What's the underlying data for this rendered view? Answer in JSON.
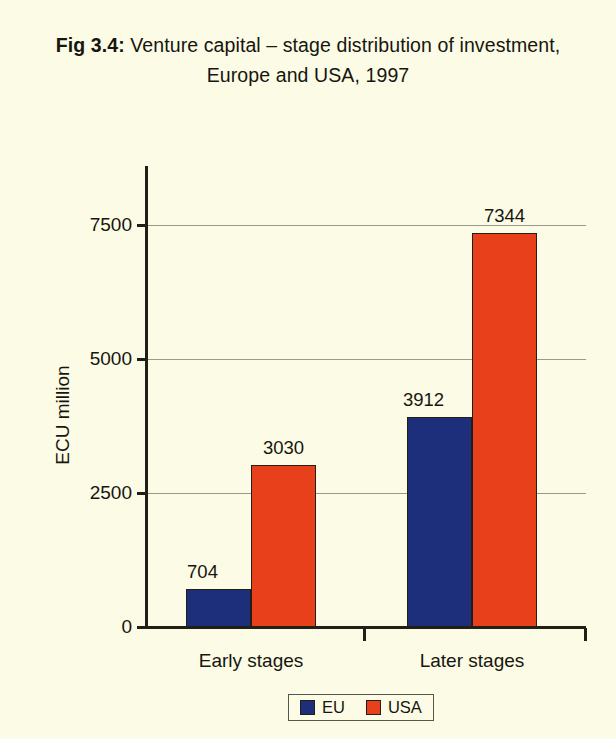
{
  "figure": {
    "title_prefix": "Fig 3.4:",
    "title_text": " Venture capital – stage distribution of investment, Europe and USA, 1997"
  },
  "chart_data": {
    "type": "bar",
    "title": "Fig 3.4: Venture capital – stage distribution of investment, Europe and USA, 1997",
    "categories": [
      "Early stages",
      "Later stages"
    ],
    "series": [
      {
        "name": "EU",
        "color": "#1d2f7b",
        "values": [
          704,
          3912
        ]
      },
      {
        "name": "USA",
        "color": "#e8401a",
        "values": [
          3030,
          7344
        ]
      }
    ],
    "xlabel": "",
    "ylabel": "ECU million",
    "ylim": [
      0,
      8550
    ],
    "yticks": [
      0,
      2500,
      5000,
      7500
    ],
    "ytick_labels": [
      "0",
      "2500",
      "5000",
      "7500"
    ],
    "gridlines": true,
    "grid_axis": "y",
    "legend_position": "bottom",
    "data_labels": true,
    "background_color": "#fcfbe6",
    "axis_color": "#221f16",
    "gridline_color": "#9a9a8c"
  },
  "axis": {
    "y_title": "ECU million",
    "ticks": [
      {
        "label": "7500",
        "value": 7500
      },
      {
        "label": "5000",
        "value": 5000
      },
      {
        "label": "2500",
        "value": 2500
      },
      {
        "label": "0",
        "value": 0
      }
    ]
  },
  "bars": [
    {
      "group": "Early stages",
      "series": "EU",
      "value": 704,
      "label": "704"
    },
    {
      "group": "Early stages",
      "series": "USA",
      "value": 3030,
      "label": "3030"
    },
    {
      "group": "Later stages",
      "series": "EU",
      "value": 3912,
      "label": "3912"
    },
    {
      "group": "Later stages",
      "series": "USA",
      "value": 7344,
      "label": "7344"
    }
  ],
  "categories": [
    {
      "label": "Early stages"
    },
    {
      "label": "Later stages"
    }
  ],
  "legend": {
    "items": [
      {
        "label": "EU",
        "color": "#1d2f7b"
      },
      {
        "label": "USA",
        "color": "#e8401a"
      }
    ]
  }
}
